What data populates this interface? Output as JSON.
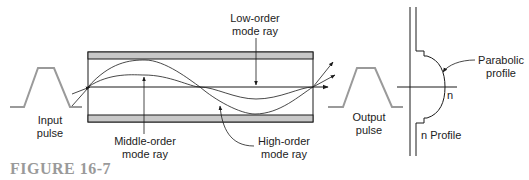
{
  "figure": {
    "caption": "FIGURE 16-7",
    "caption_color": "#9a9a9a"
  },
  "labels": {
    "input_pulse": [
      "Input",
      "pulse"
    ],
    "output_pulse": [
      "Output",
      "pulse"
    ],
    "low_order": [
      "Low-order",
      "mode ray"
    ],
    "middle_order": [
      "Middle-order",
      "mode ray"
    ],
    "high_order": [
      "High-order",
      "mode ray"
    ],
    "parabolic": [
      "Parabolic",
      "profile"
    ],
    "n_axis": "n",
    "n_profile": "n Profile"
  },
  "colors": {
    "line": "#1a1a1a",
    "cladding": "#c8c8c8",
    "pulse": "#9a9a9a"
  }
}
